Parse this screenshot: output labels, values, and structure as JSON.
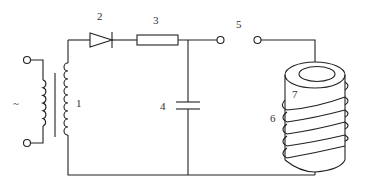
{
  "diagram": {
    "type": "circuit",
    "ac_symbol": "~",
    "labels": {
      "transformer": "1",
      "diode": "2",
      "resistor": "3",
      "capacitor": "4",
      "switch": "5",
      "coil": "6",
      "core": "7"
    },
    "components": [
      {
        "id": "1",
        "name": "transformer"
      },
      {
        "id": "2",
        "name": "diode"
      },
      {
        "id": "3",
        "name": "resistor"
      },
      {
        "id": "4",
        "name": "capacitor"
      },
      {
        "id": "5",
        "name": "switch"
      },
      {
        "id": "6",
        "name": "coil"
      },
      {
        "id": "7",
        "name": "core"
      }
    ]
  }
}
